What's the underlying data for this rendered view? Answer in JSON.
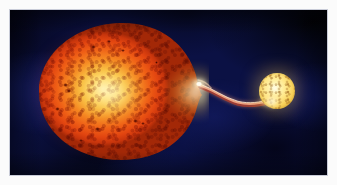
{
  "figure": {
    "domain": "natural-image",
    "kind": "astronomical-illustration",
    "caption": "",
    "title": "",
    "credit": "",
    "visible_text": []
  },
  "plate": {
    "name": "deep-space-background",
    "background_color": "#0b1144",
    "mottle_dark_color": "#05061c",
    "mottle_blue_color": "#1a2370",
    "border_color": "#c9ccd8",
    "margin_color": "#fbfbfb",
    "left": 10,
    "top": 10,
    "width": 317,
    "height": 165
  },
  "primary_star": {
    "name": "red-giant-primary",
    "label": "",
    "shape": "teardrop",
    "center_x": 110,
    "center_y": 82,
    "width": 165,
    "height": 137,
    "limb_color": "#c8350c",
    "mid_color": "#ef5f16",
    "core_color": "#fff4c4",
    "cusp_color": "#ffe884",
    "has_granulation": true,
    "starspots": [
      {
        "x": 54,
        "y": 22,
        "w": 5,
        "h": 4
      },
      {
        "x": 70,
        "y": 17,
        "w": 4,
        "h": 3
      },
      {
        "x": 84,
        "y": 26,
        "w": 4,
        "h": 3
      },
      {
        "x": 26,
        "y": 60,
        "w": 5,
        "h": 4
      },
      {
        "x": 30,
        "y": 66,
        "w": 4,
        "h": 4
      },
      {
        "x": 18,
        "y": 84,
        "w": 5,
        "h": 4
      },
      {
        "x": 58,
        "y": 104,
        "w": 5,
        "h": 4
      },
      {
        "x": 96,
        "y": 96,
        "w": 5,
        "h": 4
      },
      {
        "x": 104,
        "y": 99,
        "w": 4,
        "h": 3
      },
      {
        "x": 42,
        "y": 116,
        "w": 4,
        "h": 3
      },
      {
        "x": 118,
        "y": 38,
        "w": 3,
        "h": 3
      }
    ]
  },
  "mass_stream": {
    "name": "accretion-stream",
    "label": "",
    "from_x": 192,
    "from_y": 78,
    "to_x": 258,
    "to_y": 93,
    "core_color": "#fff2e0",
    "body_color": "#f2a07a",
    "edge_color": "#b4463a",
    "glow_color": "#ff9a6a"
  },
  "companion_star": {
    "name": "companion-accretor",
    "label": "",
    "center_x": 267,
    "center_y": 81,
    "diameter": 36,
    "body_color": "#ffe684",
    "core_color": "#fffce8",
    "limb_color": "#b8851f",
    "hotspot_color": "#fffff8",
    "has_granulation": true
  }
}
